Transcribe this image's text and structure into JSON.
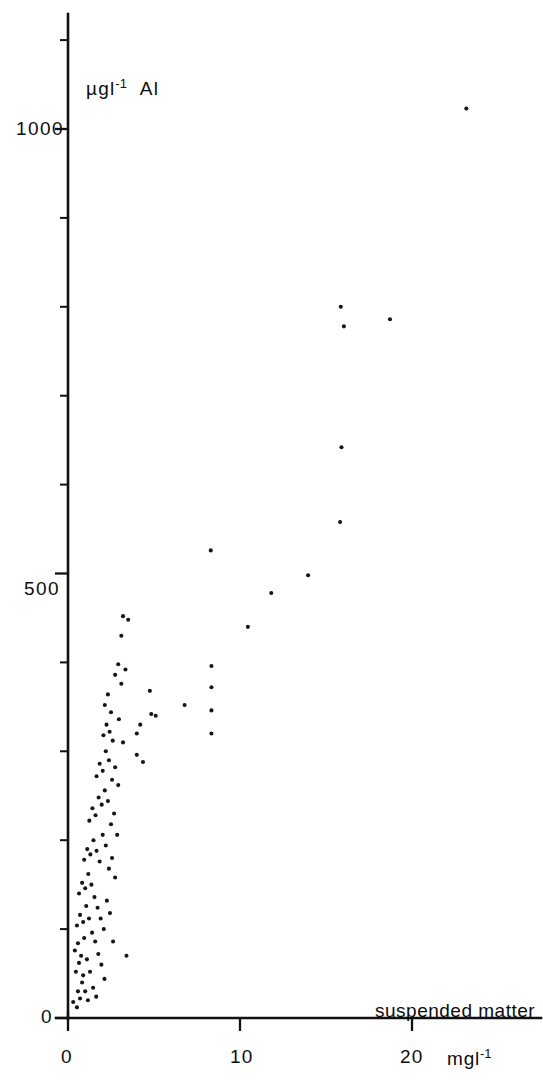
{
  "figure": {
    "background_color": "#ffffff",
    "ink_color": "#111111"
  },
  "axes": {
    "y_axis_label": "µgl⁻¹  Al",
    "y_ticks_major": [
      "0",
      "500",
      "1000"
    ],
    "x_axis_label": "suspended matter",
    "x_axis_units": "mgl⁻¹",
    "x_ticks_major": [
      "0",
      "10",
      "20"
    ]
  },
  "chart_data": {
    "type": "scatter",
    "title": "",
    "xlabel": "suspended matter",
    "xlabel_units": "mgl⁻¹",
    "ylabel": "µgl⁻¹ Al",
    "xlim": [
      0,
      27.6
    ],
    "ylim": [
      0,
      1170
    ],
    "x_ticks": [
      0,
      10,
      20
    ],
    "x_minor_tick_step": 10,
    "y_ticks": [
      0,
      500,
      1000
    ],
    "y_minor_tick_step": 100,
    "grid": false,
    "legend": null,
    "marker": "dot",
    "marker_size_px": 3,
    "series": [
      {
        "name": "Al vs suspended matter",
        "points": [
          [
            0.3,
            18
          ],
          [
            0.52,
            12
          ],
          [
            0.58,
            30
          ],
          [
            0.7,
            22
          ],
          [
            0.82,
            40
          ],
          [
            0.46,
            52
          ],
          [
            0.64,
            62
          ],
          [
            0.88,
            48
          ],
          [
            1.0,
            30
          ],
          [
            1.16,
            20
          ],
          [
            0.4,
            76
          ],
          [
            0.58,
            84
          ],
          [
            0.76,
            70
          ],
          [
            0.94,
            90
          ],
          [
            1.1,
            66
          ],
          [
            1.28,
            52
          ],
          [
            1.46,
            34
          ],
          [
            1.64,
            24
          ],
          [
            0.52,
            104
          ],
          [
            0.7,
            116
          ],
          [
            0.88,
            108
          ],
          [
            1.06,
            126
          ],
          [
            1.22,
            112
          ],
          [
            1.4,
            96
          ],
          [
            1.58,
            86
          ],
          [
            1.76,
            72
          ],
          [
            1.94,
            60
          ],
          [
            2.12,
            44
          ],
          [
            0.64,
            140
          ],
          [
            0.82,
            152
          ],
          [
            1.0,
            146
          ],
          [
            1.18,
            162
          ],
          [
            1.36,
            150
          ],
          [
            1.54,
            136
          ],
          [
            1.72,
            124
          ],
          [
            1.9,
            112
          ],
          [
            2.08,
            100
          ],
          [
            2.26,
            132
          ],
          [
            2.44,
            118
          ],
          [
            2.62,
            86
          ],
          [
            3.4,
            70
          ],
          [
            0.94,
            178
          ],
          [
            1.12,
            190
          ],
          [
            1.3,
            184
          ],
          [
            1.48,
            200
          ],
          [
            1.66,
            188
          ],
          [
            1.84,
            176
          ],
          [
            2.02,
            206
          ],
          [
            2.2,
            194
          ],
          [
            2.38,
            168
          ],
          [
            2.56,
            180
          ],
          [
            2.74,
            158
          ],
          [
            1.24,
            222
          ],
          [
            1.42,
            236
          ],
          [
            1.6,
            228
          ],
          [
            1.78,
            248
          ],
          [
            1.96,
            240
          ],
          [
            2.14,
            256
          ],
          [
            2.32,
            244
          ],
          [
            2.5,
            218
          ],
          [
            2.68,
            230
          ],
          [
            2.86,
            206
          ],
          [
            1.66,
            272
          ],
          [
            1.84,
            286
          ],
          [
            2.02,
            278
          ],
          [
            2.2,
            300
          ],
          [
            2.38,
            290
          ],
          [
            2.56,
            268
          ],
          [
            2.74,
            282
          ],
          [
            2.92,
            262
          ],
          [
            2.06,
            318
          ],
          [
            2.24,
            330
          ],
          [
            2.42,
            322
          ],
          [
            2.6,
            312
          ],
          [
            2.14,
            352
          ],
          [
            2.32,
            364
          ],
          [
            2.5,
            344
          ],
          [
            2.96,
            336
          ],
          [
            3.2,
            310
          ],
          [
            2.74,
            386
          ],
          [
            2.92,
            398
          ],
          [
            3.1,
            376
          ],
          [
            3.34,
            392
          ],
          [
            4.0,
            296
          ],
          [
            4.36,
            288
          ],
          [
            4.0,
            320
          ],
          [
            3.1,
            430
          ],
          [
            4.2,
            330
          ],
          [
            4.76,
            368
          ],
          [
            5.1,
            340
          ],
          [
            4.84,
            342
          ],
          [
            3.2,
            452
          ],
          [
            3.5,
            448
          ],
          [
            8.34,
            320
          ],
          [
            8.34,
            346
          ],
          [
            6.78,
            352
          ],
          [
            8.34,
            372
          ],
          [
            8.34,
            396
          ],
          [
            10.46,
            440
          ],
          [
            11.82,
            478
          ],
          [
            13.96,
            498
          ],
          [
            8.3,
            526
          ],
          [
            15.82,
            558
          ],
          [
            15.9,
            642
          ],
          [
            16.04,
            778
          ],
          [
            15.86,
            800
          ],
          [
            18.72,
            786
          ],
          [
            23.16,
            1023
          ],
          [
            23.2,
            1150
          ]
        ]
      }
    ]
  },
  "geometry": {
    "x_axis_origin_px": 68,
    "y_axis_origin_px": 1018,
    "px_per_x_unit": 17.2,
    "px_per_y_unit": 0.889,
    "y_axis_top_px": 14,
    "x_axis_right_px": 541
  }
}
